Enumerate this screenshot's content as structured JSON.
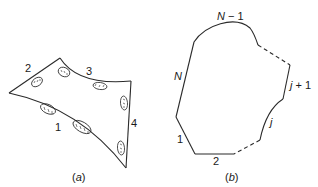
{
  "panel_a": {
    "caption": "(a)",
    "caption_letter": "a",
    "edge_labels": [
      "1",
      "2",
      "3",
      "4"
    ],
    "ellipse_count": 7
  },
  "panel_b": {
    "caption": "(b)",
    "caption_letter": "b",
    "edge_labels": {
      "one": "1",
      "two": "2",
      "j": "j",
      "j_plus_1_j": "j",
      "j_plus_1_rest": " + 1",
      "n_minus_1_n": "N",
      "n_minus_1_rest": " − 1",
      "n": "N"
    }
  },
  "colors": {
    "stroke": "#2a2a2a",
    "background": "#ffffff"
  }
}
